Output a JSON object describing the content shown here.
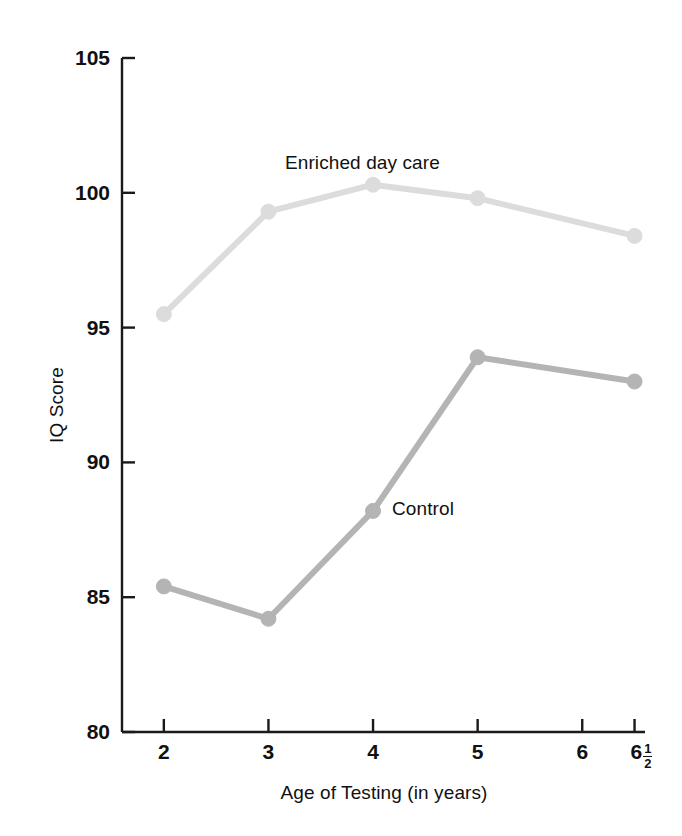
{
  "chart_data": {
    "type": "line",
    "title": "",
    "xlabel": "Age of Testing (in years)",
    "ylabel": "IQ Score",
    "x": [
      2,
      3,
      4,
      5,
      6.5
    ],
    "categories": [
      "2",
      "3",
      "4",
      "5",
      "6½"
    ],
    "xtick_labels": [
      "2",
      "3",
      "4",
      "5",
      "6",
      "6½"
    ],
    "xtick_values": [
      2,
      3,
      4,
      5,
      6,
      6.5
    ],
    "ytick_labels": [
      "80",
      "85",
      "90",
      "95",
      "100",
      "105"
    ],
    "ytick_values": [
      80,
      85,
      90,
      95,
      100,
      105
    ],
    "xlim": [
      1.6,
      6.6
    ],
    "ylim": [
      80,
      105
    ],
    "grid": false,
    "legend_position": "inline-annotation",
    "series": [
      {
        "name": "Enriched day care",
        "color": "#dcdcdc",
        "marker": "circle",
        "values": [
          95.5,
          99.3,
          100.3,
          99.8,
          98.4
        ],
        "label_x": 4.0,
        "label_y": 101.9
      },
      {
        "name": "Control",
        "color": "#b4b4b4",
        "marker": "circle",
        "values": [
          85.4,
          84.2,
          88.2,
          93.9,
          93.0
        ],
        "label_x": 4.5,
        "label_y": 88.0
      }
    ],
    "annotations": [
      {
        "text": "Enriched day care",
        "series": "Enriched day care"
      },
      {
        "text": "Control",
        "series": "Control"
      }
    ]
  },
  "axes": {
    "y_title": "IQ Score",
    "x_title": "Age of Testing (in years)",
    "y_ticks": [
      {
        "label": "105",
        "value": 105
      },
      {
        "label": "100",
        "value": 100
      },
      {
        "label": "95",
        "value": 95
      },
      {
        "label": "90",
        "value": 90
      },
      {
        "label": "85",
        "value": 85
      },
      {
        "label": "80",
        "value": 80
      }
    ],
    "x_ticks": [
      {
        "label": "2",
        "value": 2,
        "fraction": null
      },
      {
        "label": "3",
        "value": 3,
        "fraction": null
      },
      {
        "label": "4",
        "value": 4,
        "fraction": null
      },
      {
        "label": "5",
        "value": 5,
        "fraction": null
      },
      {
        "label": "6",
        "value": 6,
        "fraction": null
      },
      {
        "label": "6",
        "value": 6.5,
        "fraction": {
          "numerator": "1",
          "denominator": "2"
        }
      }
    ]
  },
  "colors": {
    "axis": "#1a1a1a",
    "text": "#111111",
    "background": "#ffffff",
    "series_enriched": "#dcdcdc",
    "series_control": "#b4b4b4"
  }
}
